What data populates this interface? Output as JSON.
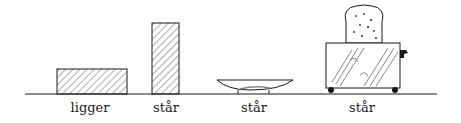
{
  "figure": {
    "colors": {
      "ink": "#1a1a1a",
      "background": "#ffffff"
    },
    "items": [
      {
        "id": "lying-block",
        "label": "ligger",
        "label_x": 90
      },
      {
        "id": "standing-block",
        "label": "står",
        "label_x": 166
      },
      {
        "id": "bowl",
        "label": "står",
        "label_x": 254
      },
      {
        "id": "toaster",
        "label": "står",
        "label_x": 362
      }
    ]
  }
}
